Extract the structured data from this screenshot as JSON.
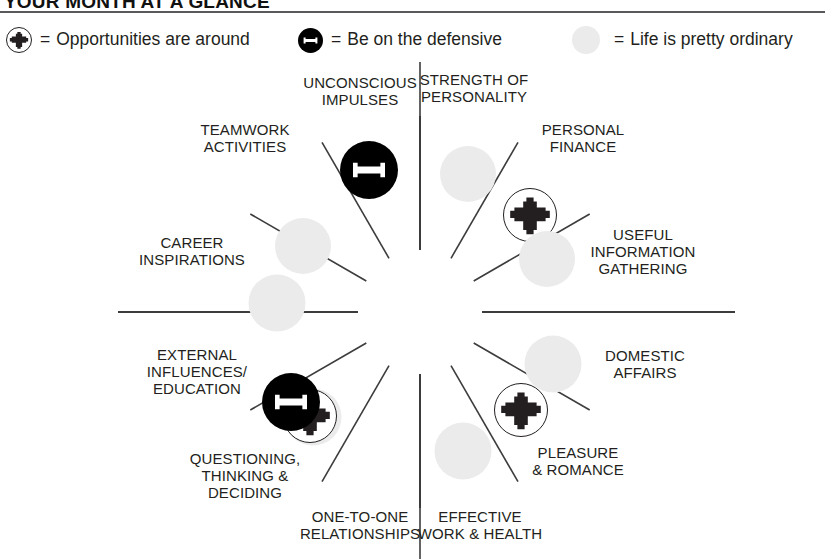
{
  "header": {
    "title_lead": "Y",
    "title_rest": "OUR ",
    "title": "YOUR MONTH AT A GLANCE",
    "rule_color": "#59585c"
  },
  "legend": {
    "items": [
      {
        "marker": "plus-icon",
        "equals": "=",
        "label": "Opportunities are around",
        "x": 6,
        "size": 26
      },
      {
        "marker": "minus-icon",
        "equals": "=",
        "label": "Be on the defensive",
        "x": 298,
        "size": 25
      },
      {
        "marker": "dot-icon",
        "equals": "=",
        "label": "Life is pretty ordinary",
        "x": 572,
        "size": 28
      }
    ]
  },
  "wheel": {
    "center": {
      "x": 420,
      "y": 256
    },
    "inner_radius": 62,
    "outer_radius": 196,
    "line_color": "#3c3c3c",
    "sectors": [
      {
        "id": "unconscious-impulses",
        "label": "UNCONSCIOUS\nIMPULSES",
        "marker": "minus-icon",
        "marker_x": 369,
        "marker_y": 114,
        "marker_size": 58,
        "label_x": 360,
        "label_y": 36
      },
      {
        "id": "strength-of-personality",
        "label": "STRENGTH OF\nPERSONALITY",
        "marker": "dot-icon",
        "marker_x": 468,
        "marker_y": 118,
        "marker_size": 56,
        "label_x": 474,
        "label_y": 33
      },
      {
        "id": "personal-finance",
        "label": "PERSONAL\nFINANCE",
        "marker": "plus-icon",
        "marker_x": 530,
        "marker_y": 159,
        "marker_size": 54,
        "label_x": 583,
        "label_y": 83
      },
      {
        "id": "useful-information-gathering",
        "label": "USEFUL\nINFORMATION\nGATHERING",
        "marker": "dot-icon",
        "marker_x": 547,
        "marker_y": 203,
        "marker_size": 56,
        "label_x": 643,
        "label_y": 196
      },
      {
        "id": "domestic-affairs",
        "label": "DOMESTIC\nAFFAIRS",
        "marker": "dot-icon",
        "marker_x": 553,
        "marker_y": 308,
        "marker_size": 57,
        "label_x": 645,
        "label_y": 309
      },
      {
        "id": "pleasure-and-romance",
        "label": "PLEASURE\n& ROMANCE",
        "marker": "plus-icon",
        "marker_x": 521,
        "marker_y": 354,
        "marker_size": 54,
        "label_x": 578,
        "label_y": 406
      },
      {
        "id": "effective-work-and-health",
        "label": "EFFECTIVE\nWORK & HEALTH",
        "marker": "dot-icon",
        "marker_x": 463,
        "marker_y": 395,
        "marker_size": 57,
        "label_x": 480,
        "label_y": 470
      },
      {
        "id": "one-to-one-relationships",
        "label": "ONE-TO-ONE\nRELATIONSHIPS",
        "marker": "plus-icon",
        "marker_x": 310,
        "marker_y": 360,
        "marker_size": 54,
        "label_x": 360,
        "label_y": 470
      },
      {
        "id": "questioning-thinking-deciding",
        "label": "QUESTIONING,\nTHINKING &\nDECIDING",
        "marker": "dot-icon",
        "marker_x": 313,
        "marker_y": 361,
        "marker_size": 0,
        "label_x": 245,
        "label_y": 420
      },
      {
        "id": "external-influences-education",
        "label": "EXTERNAL\nINFLUENCES/\nEDUCATION",
        "marker": "minus-icon",
        "marker_x": 291,
        "marker_y": 346,
        "marker_size": 58,
        "label_x": 197,
        "label_y": 316
      },
      {
        "id": "career-inspirations",
        "label": "CAREER\nINSPIRATIONS",
        "marker": "dot-icon",
        "marker_x": 277,
        "marker_y": 247,
        "marker_size": 57,
        "label_x": 192,
        "label_y": 196
      },
      {
        "id": "teamwork-activities",
        "label": "TEAMWORK\nACTIVITIES",
        "marker": "dot-icon",
        "marker_x": 303,
        "marker_y": 190,
        "marker_size": 56,
        "label_x": 245,
        "label_y": 83
      }
    ],
    "extra_dots": [
      {
        "id": "questioning-dot",
        "x": 313,
        "y": 361,
        "size": 57
      }
    ]
  },
  "chart_data": {
    "type": "pie",
    "title": "YOUR MONTH AT A GLANCE",
    "legend_position": "top",
    "legend": [
      {
        "symbol": "+",
        "meaning": "Opportunities are around"
      },
      {
        "symbol": "-",
        "meaning": "Be on the defensive"
      },
      {
        "symbol": "o",
        "meaning": "Life is pretty ordinary"
      }
    ],
    "categories": [
      "UNCONSCIOUS IMPULSES",
      "STRENGTH OF PERSONALITY",
      "PERSONAL FINANCE",
      "USEFUL INFORMATION GATHERING",
      "DOMESTIC AFFAIRS",
      "PLEASURE & ROMANCE",
      "EFFECTIVE WORK & HEALTH",
      "ONE-TO-ONE RELATIONSHIPS",
      "QUESTIONING, THINKING & DECIDING",
      "EXTERNAL INFLUENCES/EDUCATION",
      "CAREER INSPIRATIONS",
      "TEAMWORK ACTIVITIES"
    ],
    "values": [
      "negative",
      "ordinary",
      "positive",
      "ordinary",
      "ordinary",
      "positive",
      "ordinary",
      "positive",
      "ordinary",
      "negative",
      "ordinary",
      "ordinary"
    ],
    "slices": 12,
    "xlabel": "",
    "ylabel": ""
  }
}
